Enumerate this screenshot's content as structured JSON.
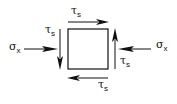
{
  "diagram": {
    "element": "square-element",
    "labels": {
      "shear_top": {
        "symbol": "τ",
        "sub": "s"
      },
      "shear_bottom": {
        "symbol": "τ",
        "sub": "s"
      },
      "shear_left": {
        "symbol": "τ",
        "sub": "s"
      },
      "shear_right": {
        "symbol": "τ",
        "sub": "s"
      },
      "normal_left": {
        "symbol": "σ",
        "sub": "x"
      },
      "normal_right": {
        "symbol": "σ",
        "sub": "x"
      }
    },
    "arrows": [
      {
        "name": "shear-top-arrow",
        "direction": "right"
      },
      {
        "name": "shear-bottom-arrow",
        "direction": "left"
      },
      {
        "name": "shear-left-arrow",
        "direction": "down"
      },
      {
        "name": "shear-right-arrow",
        "direction": "up"
      },
      {
        "name": "normal-left-arrow",
        "direction": "right"
      },
      {
        "name": "normal-right-arrow",
        "direction": "left"
      }
    ],
    "colors": {
      "stroke": "#111111",
      "background": "#ffffff"
    }
  }
}
